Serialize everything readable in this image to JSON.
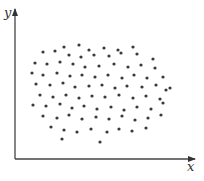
{
  "chart_data": {
    "type": "scatter",
    "title": "",
    "xlabel": "x",
    "ylabel": "y",
    "grid": false,
    "legend": null,
    "ticks": false,
    "coordinate_system": "pixel (origin at axis intersection, y up)",
    "xlim": [
      0,
      178
    ],
    "ylim": [
      0,
      149
    ],
    "points": [
      [
        64,
        114
      ],
      [
        49,
        112
      ],
      [
        74,
        109
      ],
      [
        89,
        111
      ],
      [
        103,
        109
      ],
      [
        118,
        112
      ],
      [
        28,
        107
      ],
      [
        40,
        108
      ],
      [
        54,
        104
      ],
      [
        66,
        102
      ],
      [
        79,
        104
      ],
      [
        94,
        103
      ],
      [
        106,
        106
      ],
      [
        122,
        105
      ],
      [
        138,
        100
      ],
      [
        20,
        96
      ],
      [
        32,
        95
      ],
      [
        45,
        97
      ],
      [
        58,
        95
      ],
      [
        70,
        92
      ],
      [
        84,
        93
      ],
      [
        99,
        95
      ],
      [
        113,
        92
      ],
      [
        126,
        94
      ],
      [
        140,
        91
      ],
      [
        17,
        86
      ],
      [
        28,
        84
      ],
      [
        42,
        86
      ],
      [
        55,
        83
      ],
      [
        67,
        84
      ],
      [
        80,
        82
      ],
      [
        93,
        84
      ],
      [
        107,
        81
      ],
      [
        119,
        84
      ],
      [
        132,
        81
      ],
      [
        148,
        82
      ],
      [
        21,
        75
      ],
      [
        35,
        74
      ],
      [
        48,
        76
      ],
      [
        60,
        72
      ],
      [
        74,
        73
      ],
      [
        87,
        74
      ],
      [
        100,
        71
      ],
      [
        112,
        73
      ],
      [
        127,
        72
      ],
      [
        141,
        74
      ],
      [
        155,
        71
      ],
      [
        25,
        64
      ],
      [
        38,
        62
      ],
      [
        51,
        64
      ],
      [
        64,
        61
      ],
      [
        77,
        63
      ],
      [
        90,
        62
      ],
      [
        104,
        64
      ],
      [
        118,
        61
      ],
      [
        131,
        63
      ],
      [
        145,
        60
      ],
      [
        151,
        69
      ],
      [
        18,
        54
      ],
      [
        31,
        53
      ],
      [
        45,
        55
      ],
      [
        57,
        51
      ],
      [
        69,
        53
      ],
      [
        82,
        50
      ],
      [
        96,
        52
      ],
      [
        109,
        49
      ],
      [
        122,
        52
      ],
      [
        136,
        50
      ],
      [
        148,
        56
      ],
      [
        28,
        43
      ],
      [
        42,
        41
      ],
      [
        54,
        44
      ],
      [
        67,
        40
      ],
      [
        81,
        42
      ],
      [
        94,
        40
      ],
      [
        107,
        43
      ],
      [
        120,
        39
      ],
      [
        133,
        41
      ],
      [
        146,
        44
      ],
      [
        36,
        32
      ],
      [
        49,
        29
      ],
      [
        62,
        27
      ],
      [
        76,
        30
      ],
      [
        92,
        27
      ],
      [
        104,
        30
      ],
      [
        117,
        28
      ],
      [
        131,
        31
      ],
      [
        47,
        20
      ],
      [
        85,
        17
      ]
    ]
  },
  "axes": {
    "x_label": "x",
    "y_label": "y"
  }
}
